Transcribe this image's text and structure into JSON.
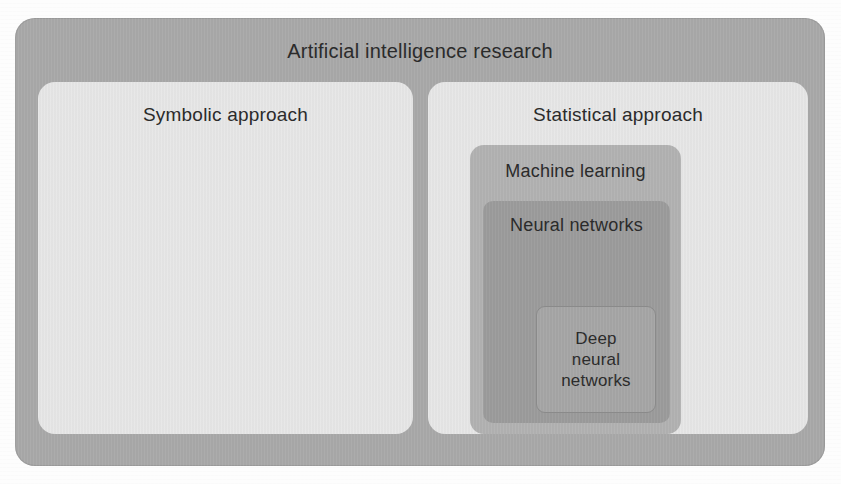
{
  "diagram": {
    "title": "Artificial intelligence research",
    "outer": {
      "label": "Artificial intelligence research",
      "color": "#a9a9a9"
    },
    "symbolic": {
      "label": "Symbolic approach",
      "color": "#e7e7e7"
    },
    "statistical": {
      "label": "Statistical approach",
      "color": "#e7e7e7"
    },
    "machine_learning": {
      "label": "Machine learning",
      "color": "#b2b2b2"
    },
    "neural_networks": {
      "label": "Neural networks",
      "color": "#9c9c9c"
    },
    "deep_neural_networks": {
      "label": "Deep neural networks",
      "line1": "Deep",
      "line2": "neural",
      "line3": "networks",
      "color": "#a6a6a6"
    }
  },
  "chart_data": {
    "type": "diagram",
    "subtype": "nested-set-containment",
    "title": "Artificial intelligence research",
    "nodes": [
      {
        "id": "ai",
        "label": "Artificial intelligence research",
        "level": 0,
        "parent": null,
        "fill": "#a9a9a9"
      },
      {
        "id": "symbolic",
        "label": "Symbolic approach",
        "level": 1,
        "parent": "ai",
        "fill": "#e7e7e7"
      },
      {
        "id": "statistical",
        "label": "Statistical approach",
        "level": 1,
        "parent": "ai",
        "fill": "#e7e7e7"
      },
      {
        "id": "machine_learning",
        "label": "Machine learning",
        "level": 2,
        "parent": "statistical",
        "fill": "#b2b2b2"
      },
      {
        "id": "neural_networks",
        "label": "Neural networks",
        "level": 3,
        "parent": "machine_learning",
        "fill": "#9c9c9c"
      },
      {
        "id": "deep_neural_networks",
        "label": "Deep neural networks",
        "level": 4,
        "parent": "neural_networks",
        "fill": "#a6a6a6"
      }
    ]
  }
}
